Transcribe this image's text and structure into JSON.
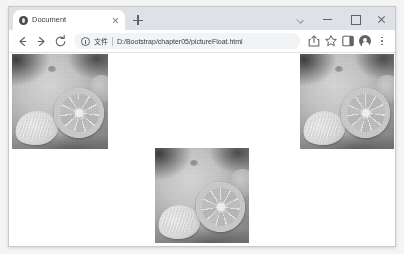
{
  "window": {
    "controls": {
      "tab_search_label": "tab-search",
      "minimize_label": "minimize",
      "maximize_label": "maximize",
      "close_label": "close"
    }
  },
  "tabstrip": {
    "tabs": [
      {
        "title": "Document",
        "favicon": "globe-icon",
        "active": true
      }
    ],
    "new_tab_label": "+"
  },
  "toolbar": {
    "back_label": "back",
    "forward_label": "forward",
    "reload_label": "reload",
    "omnibox": {
      "security_icon": "info-circle-icon",
      "scheme_label": "文件",
      "url": "D:/Bootstrap/chapter05/pictureFloat.html"
    },
    "actions": [
      {
        "name": "share-icon",
        "label": "share"
      },
      {
        "name": "bookmark-star-icon",
        "label": "bookmark"
      },
      {
        "name": "side-panel-icon",
        "label": "side panel"
      },
      {
        "name": "profile-avatar",
        "label": "profile"
      },
      {
        "name": "kebab-menu-icon",
        "label": "menu"
      }
    ]
  },
  "page": {
    "background": "#ffffff",
    "images": [
      {
        "id": "picture-left",
        "alt": "citrus fruit photo floated left",
        "float": "left"
      },
      {
        "id": "picture-right",
        "alt": "citrus fruit photo floated right",
        "float": "right"
      },
      {
        "id": "picture-center",
        "alt": "citrus fruit photo centered",
        "float": "none"
      }
    ]
  },
  "colors": {
    "tabstrip_bg": "#dee1e6",
    "toolbar_bg": "#ffffff",
    "omnibox_bg": "#f1f3f4",
    "text": "#3c4043",
    "icon": "#5f6368",
    "desktop_bg": "#f4f4f4"
  }
}
